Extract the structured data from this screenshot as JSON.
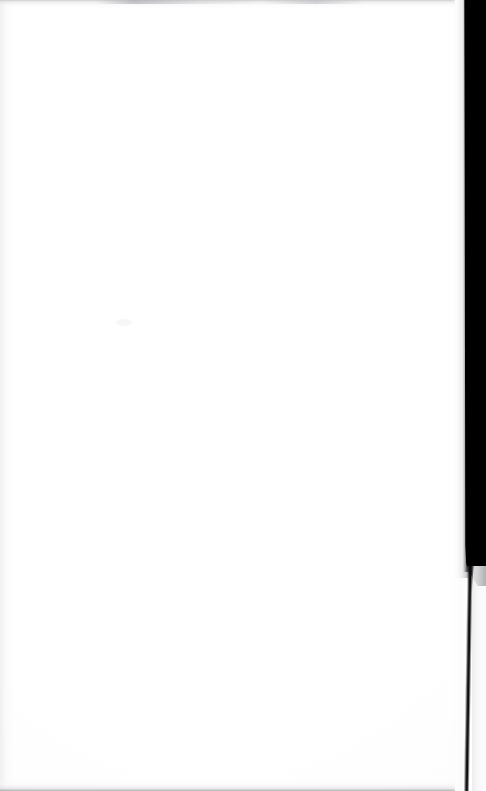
{
  "page": {
    "kind": "scanned-blank-page",
    "width": 486,
    "height": 791,
    "visible_text": "",
    "text_note": "No legible text, headings, figures or marks are present on this page.",
    "content_description": "A blank white scanned page; the right portion of the frame is a solid black scanner void that narrows to a thin dark seam toward the bottom."
  },
  "regions": {
    "paper": {
      "label": "Blank page",
      "color": "#ffffff",
      "left": 0,
      "width": 455
    },
    "page_edge": {
      "label": "Page edge shadow",
      "color": "#a8a9ad",
      "left": 452,
      "width": 16
    },
    "gutter_void": {
      "label": "Scanner void",
      "color": "#000000",
      "left": 466,
      "width": 20,
      "bottom": 586
    },
    "gutter_seam": {
      "label": "Gutter seam",
      "color": "#121214",
      "left": 469,
      "width": 3,
      "top": 566
    },
    "backing_strip": {
      "label": "Backing board",
      "color": "#ececee",
      "left": 472,
      "width": 14,
      "top": 566
    },
    "top_smudge": {
      "label": "Top edge smudge",
      "color": "#b0b1b4"
    },
    "bottom_edge": {
      "label": "Bottom edge line",
      "color": "#96979b"
    }
  }
}
